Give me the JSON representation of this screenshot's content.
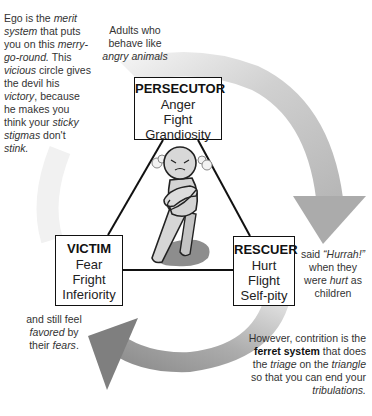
{
  "diagram": {
    "colors": {
      "arrow_gray": "#a8a8a8",
      "arrow_dark": "#7c7c7c",
      "figure_fill": "#d4d4d4",
      "shadow": "#8a8a8a",
      "line": "#111111"
    },
    "roles": {
      "persecutor": {
        "title": "PERSECUTOR",
        "lines": [
          "Anger",
          "Fight",
          "Grandiosity"
        ]
      },
      "victim": {
        "title": "VICTIM",
        "lines": [
          "Fear",
          "Fright",
          "Inferiority"
        ]
      },
      "rescuer": {
        "title": "RESCUER",
        "lines": [
          "Hurt",
          "Flight",
          "Self-pity"
        ]
      }
    },
    "icons": {
      "cycle_arrow": "curved-arrow-icon",
      "figure": "angry-person-icon"
    },
    "notes": {
      "ego": {
        "segments": [
          {
            "t": "Ego is the ",
            "s": ""
          },
          {
            "t": "merit system",
            "s": "i"
          },
          {
            "t": " that puts you on this ",
            "s": ""
          },
          {
            "t": "merry-go-round.",
            "s": "i"
          },
          {
            "t": " This ",
            "s": ""
          },
          {
            "t": "vicious",
            "s": "i"
          },
          {
            "t": " circle gives the devil his ",
            "s": ""
          },
          {
            "t": "victory",
            "s": "i"
          },
          {
            "t": ", because he makes you think your ",
            "s": ""
          },
          {
            "t": "sticky stigmas",
            "s": "i"
          },
          {
            "t": " don't ",
            "s": ""
          },
          {
            "t": "stink.",
            "s": "i"
          }
        ]
      },
      "adults": {
        "segments": [
          {
            "t": "Adults who behave like ",
            "s": ""
          },
          {
            "t": "angry animals",
            "s": "i"
          }
        ]
      },
      "hurrah": {
        "segments": [
          {
            "t": "said ",
            "s": ""
          },
          {
            "t": "“Hurrah!”",
            "s": "i"
          },
          {
            "t": " when they were ",
            "s": ""
          },
          {
            "t": "hurt",
            "s": "i"
          },
          {
            "t": " as children",
            "s": ""
          }
        ]
      },
      "favored": {
        "segments": [
          {
            "t": "and still feel ",
            "s": ""
          },
          {
            "t": "favored",
            "s": "i"
          },
          {
            "t": " by their ",
            "s": ""
          },
          {
            "t": "fears",
            "s": "i"
          },
          {
            "t": ".",
            "s": ""
          }
        ]
      },
      "however": {
        "segments": [
          {
            "t": "However, contrition is the ",
            "s": ""
          },
          {
            "t": "ferret system",
            "s": "b"
          },
          {
            "t": " that does the ",
            "s": ""
          },
          {
            "t": "triage",
            "s": "i"
          },
          {
            "t": " on the ",
            "s": ""
          },
          {
            "t": "triangle",
            "s": "i"
          },
          {
            "t": " so that you can end your ",
            "s": ""
          },
          {
            "t": "tribulations.",
            "s": "i"
          }
        ]
      }
    }
  }
}
